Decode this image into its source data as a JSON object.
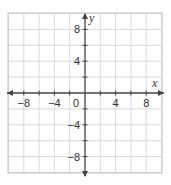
{
  "chart_data": {
    "type": "scatter",
    "title": "",
    "xlabel": "x",
    "ylabel": "y",
    "xlim": [
      -10,
      10
    ],
    "ylim": [
      -10,
      10
    ],
    "grid": true,
    "grid_step": 2,
    "x_tick_labels": [
      "−8",
      "−4",
      "4",
      "8"
    ],
    "x_tick_values": [
      -8,
      -4,
      4,
      8
    ],
    "y_tick_labels": [
      "8",
      "4",
      "−4",
      "−8"
    ],
    "y_tick_values": [
      8,
      4,
      -4,
      -8
    ],
    "origin_label": "0",
    "series": [],
    "legend": null
  },
  "colors": {
    "grid": "#d9d9d9",
    "border": "#cccccc",
    "axis": "#444444",
    "text": "#333333"
  }
}
